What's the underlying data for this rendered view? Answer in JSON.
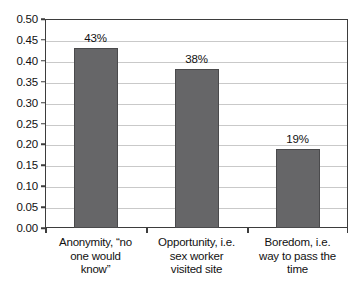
{
  "chart_data": {
    "type": "bar",
    "title": "",
    "subtitle": "",
    "xlabel": "",
    "ylabel": "",
    "categories": [
      "Anonymity, “no one would know”",
      "Opportunity, i.e. sex worker visited site",
      "Boredom, i.e. way to pass the time"
    ],
    "category_lines": [
      [
        "Anonymity, “no",
        "one would",
        "know”"
      ],
      [
        "Opportunity, i.e.",
        "sex worker",
        "visited site"
      ],
      [
        "Boredom, i.e.",
        "way to pass the",
        "time"
      ]
    ],
    "values": [
      0.43,
      0.38,
      0.19
    ],
    "data_labels": [
      "43%",
      "38%",
      "19%"
    ],
    "ylim": [
      0.0,
      0.5
    ],
    "ytick_step": 0.05,
    "ytick_labels": [
      "0.50",
      "0.45",
      "0.40",
      "0.35",
      "0.30",
      "0.25",
      "0.20",
      "0.15",
      "0.10",
      "0.05",
      "0.00"
    ],
    "ytick_values": [
      0.5,
      0.45,
      0.4,
      0.35,
      0.3,
      0.25,
      0.2,
      0.15,
      0.1,
      0.05,
      0.0
    ],
    "grid": true,
    "legend": false,
    "legend_position": "none",
    "bar_color": "#666668",
    "bar_border_color": "#4a4a4c",
    "gridline_color": "#c9c9c9",
    "axis_color": "#3d3d3d",
    "background_color": "#ffffff"
  }
}
